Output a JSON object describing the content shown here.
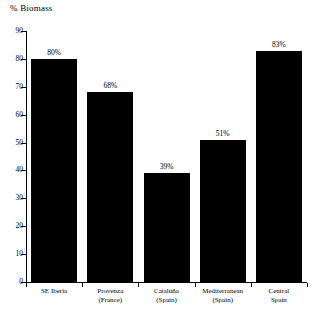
{
  "chart_data": {
    "type": "bar",
    "title": "% Biomass",
    "xlabel": "",
    "ylabel": "",
    "ylim": [
      0,
      90
    ],
    "ytick_step": 10,
    "yticks": [
      0,
      10,
      20,
      30,
      40,
      50,
      60,
      70,
      80,
      90
    ],
    "grid": false,
    "legend": null,
    "bar_color": "#000000",
    "axis_color": "#000000",
    "background": "#ffffff",
    "categories": [
      "SE Iberia",
      "Provenza (France)",
      "Cataluña (Spain)",
      "Mediterranean (Spain)",
      "Central Spain"
    ],
    "category_lines": [
      {
        "line1": "SE Iberia",
        "line2": ""
      },
      {
        "line1": "Provenza",
        "line2": "(France)"
      },
      {
        "line1": "Cataluña",
        "line2": "(Spain)"
      },
      {
        "line1": "Mediterranean",
        "line2": "(Spain)"
      },
      {
        "line1": "Central",
        "line2": "Spain"
      }
    ],
    "values": [
      80,
      68,
      39,
      51,
      83
    ],
    "data_labels": [
      "80%",
      "68%",
      "39%",
      "51%",
      "83%"
    ]
  }
}
